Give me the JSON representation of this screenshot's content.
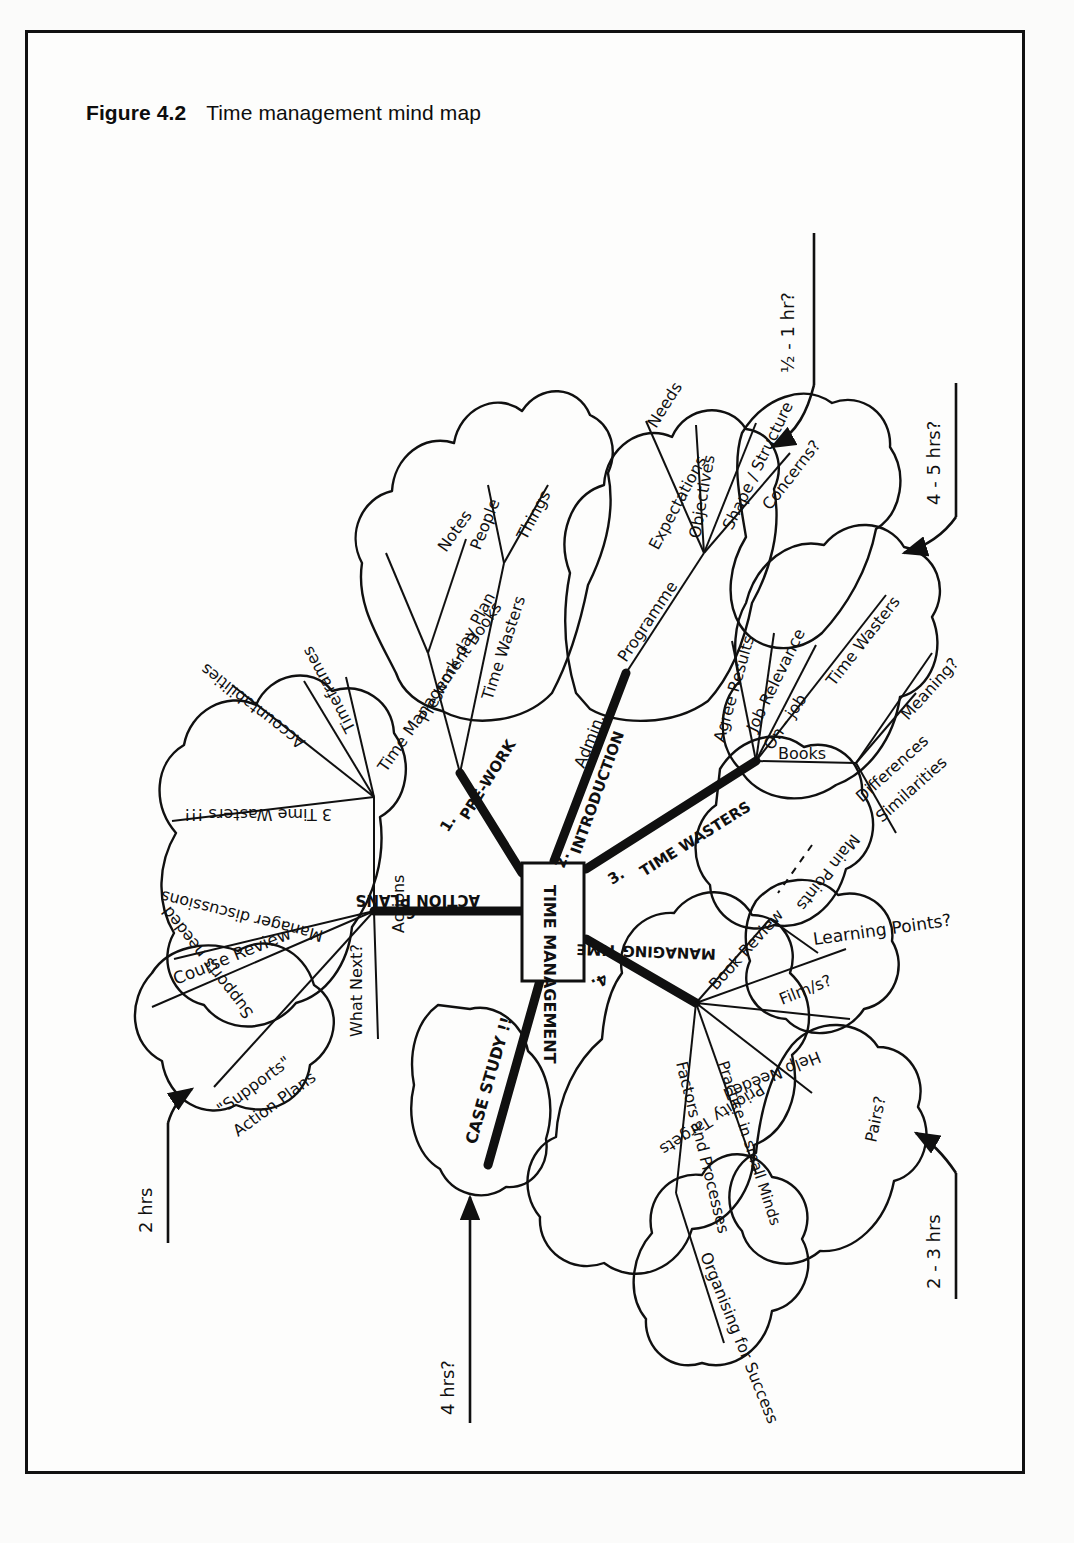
{
  "figure": {
    "label": "Figure 4.2",
    "title": "Time management mind map"
  },
  "mindmap": {
    "center": "TIME MANAGEMENT",
    "main_branches": [
      {
        "id": "pre-work",
        "number": "1.",
        "label": "PRE-WORK"
      },
      {
        "id": "introduction",
        "number": "2.",
        "label": "INTRODUCTION"
      },
      {
        "id": "time-wasters",
        "number": "3.",
        "label": "TIME WASTERS"
      },
      {
        "id": "managing-time",
        "number": "4.",
        "label": "MANAGING TIME"
      },
      {
        "id": "case-study",
        "number": "5.",
        "label": "CASE STUDY !!"
      },
      {
        "id": "action-plans",
        "number": "6.",
        "label": "ACTION PLANS"
      }
    ],
    "pre_work_subtopics": [
      "Time Management Books",
      "Notes",
      "Pre work-day Plan",
      "Time Wasters",
      "People",
      "Things"
    ],
    "introduction_subtopics": [
      "Admin.",
      "Programme",
      "Expectations",
      "Needs",
      "Objectives",
      "Shape / Structure",
      "Concerns?"
    ],
    "time_wasters_subtopics": [
      "Agree Results",
      "Job Relevance",
      "On - job",
      "Time Wasters",
      "Books",
      "Differences",
      "Similarities",
      "Meaning?",
      "Main Points"
    ],
    "managing_time_subtopics": [
      "Book Review",
      "Film/s?",
      "Learning Points?",
      "Help Needed",
      "Pairs?",
      "Priority Targets",
      "Practice in small Minds",
      "Factors and Processes",
      "Organising for Success"
    ],
    "action_plans_subtopics": [
      "3 Time Wasters !!!",
      "Accountabilities",
      "Timeframes",
      "Actions",
      "Manager discussions",
      "Course Review",
      "Supports needed",
      "What Next?",
      "\"Supports\"",
      "Action Plans"
    ],
    "time_annotations": [
      {
        "id": "half-to-one-hr",
        "label": "½ - 1 hr?"
      },
      {
        "id": "four-five-hrs",
        "label": "4 - 5 hrs?"
      },
      {
        "id": "two-three-hrs",
        "label": "2 - 3 hrs"
      },
      {
        "id": "four-hrs",
        "label": "4 hrs?"
      },
      {
        "id": "two-hrs",
        "label": "2 hrs"
      }
    ]
  },
  "colors": {
    "ink": "#101010",
    "paper": "#fdfdfc",
    "frame": "#111111"
  }
}
